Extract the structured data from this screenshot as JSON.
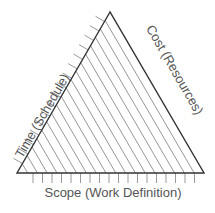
{
  "diagram": {
    "type": "project-management-triangle",
    "labels": {
      "left": "Time (Schedule)",
      "right": "Cost (Resources)",
      "bottom": "Scope (Work Definition)"
    },
    "colors": {
      "outline": "#333333",
      "hatch": "#8a8a8a",
      "ticks": "#9a9a9a",
      "text": "#555555"
    }
  }
}
